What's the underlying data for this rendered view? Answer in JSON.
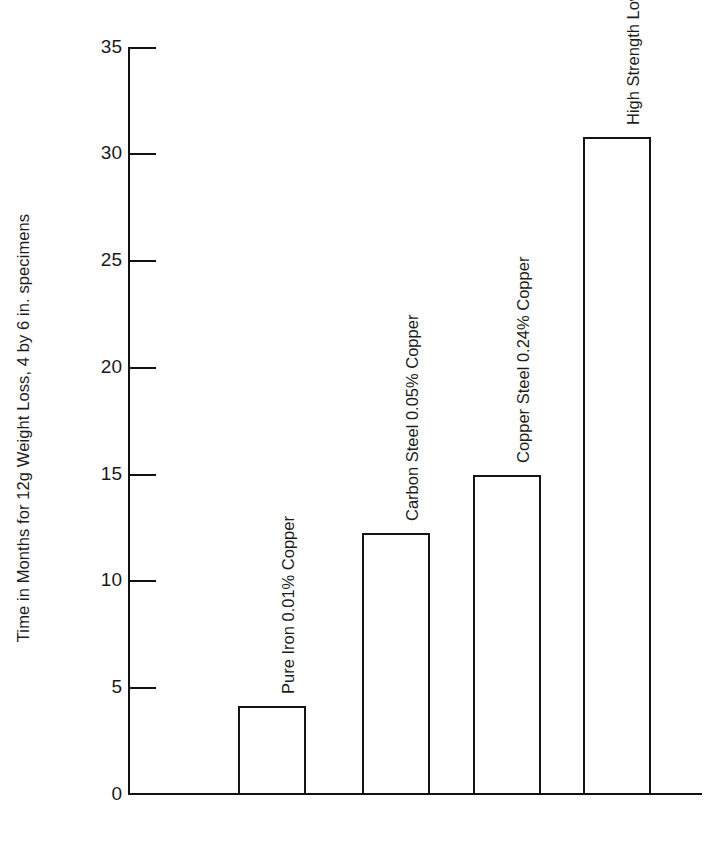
{
  "chart_data": {
    "type": "bar",
    "title": "",
    "subtitle": "",
    "xlabel": "",
    "ylabel": "Time in Months for 12g Weight Loss, 4 by 6 in. specimens",
    "categories": [
      "Pure Iron 0.01% Copper",
      "Carbon Steel 0.05% Copper",
      "Copper Steel 0.24% Copper",
      "High Strength Low Alloy Steel"
    ],
    "values": [
      4.1,
      12.2,
      14.9,
      30.8
    ],
    "ylim": [
      0,
      35
    ],
    "ytick_labels": [
      "0",
      "5",
      "10",
      "15",
      "20",
      "25",
      "30",
      "35"
    ],
    "ytick_values": [
      0,
      5,
      10,
      15,
      20,
      25,
      30,
      35
    ],
    "xtick_labels": [],
    "grid": false,
    "legend": null,
    "legend_position": "none",
    "bar_style": "outline",
    "bar_fill_color": "#ffffff",
    "bar_edge_color": "#151515",
    "axis_color": "#111111",
    "background_color": "#ffffff",
    "label_orientation": "vertical",
    "annotations": []
  },
  "axis": {
    "y_title": "Time in Months for 12g Weight Loss, 4 by 6 in. specimens"
  }
}
